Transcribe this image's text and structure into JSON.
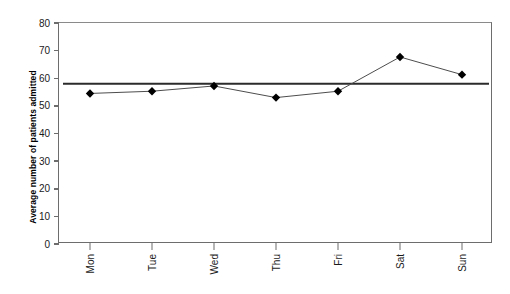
{
  "chart_data": {
    "type": "line",
    "title": "",
    "xlabel": "",
    "ylabel": "Average number of patients admitted",
    "categories": [
      "Mon",
      "Tue",
      "Wed",
      "Thu",
      "Fri",
      "Sat",
      "Sun"
    ],
    "values": [
      54.5,
      55.3,
      57.2,
      53.0,
      55.3,
      67.7,
      61.3
    ],
    "series": [
      {
        "name": "Average number of patients admitted",
        "values": [
          54.5,
          55.3,
          57.2,
          53.0,
          55.3,
          67.7,
          61.3
        ],
        "marker": "diamond",
        "marker_color": "#000000",
        "line_color": "#4d4d4d"
      }
    ],
    "reference_line": {
      "name": "mean",
      "value": 58.0,
      "color": "#2b2b2b",
      "orientation": "horizontal"
    },
    "ylim": [
      0,
      80
    ],
    "yticks": [
      0,
      10,
      20,
      30,
      40,
      50,
      60,
      70,
      80
    ],
    "ytick_labels": [
      "0",
      "10",
      "20",
      "30",
      "40",
      "50",
      "60",
      "70",
      "80"
    ],
    "xtick_labels": [
      "Mon",
      "Tue",
      "Wed",
      "Thu",
      "Fri",
      "Sat",
      "Sun"
    ],
    "grid": false,
    "legend": "none",
    "axis_color": "#6d6d6d",
    "background": "#ffffff"
  }
}
